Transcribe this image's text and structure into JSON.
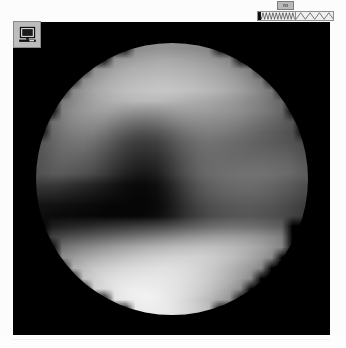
{
  "window": {
    "title": "Image Viewer"
  },
  "toolbar": {
    "display_button": {
      "name": "display-settings-button",
      "icon": "monitor-icon",
      "tooltip": "Display"
    }
  },
  "waveform_widget": {
    "label": "m",
    "dense_pane_name": "dense-waveform",
    "sparse_pane_name": "sparse-waveform",
    "tick_name": "waveform-cursor",
    "dense_cycles": 11,
    "sparse_cycles": 4,
    "border_color": "#8e8e8e",
    "background_color": "#efefef",
    "label_background": "#b9b9b9"
  },
  "viewport": {
    "name": "image-canvas",
    "background_color": "#000000",
    "width": 317,
    "height": 313
  },
  "image": {
    "subject": "grayscale-sphere",
    "description": "Pixelated grayscale image of an illuminated sphere (planetary disk) on a black background",
    "diameter_px": 272,
    "colormap": "grayscale",
    "features": {
      "bright_bottom_limb": true,
      "dark_equatorial_band": true,
      "bright_patch_right_of_center": true,
      "dark_blotch_center": true
    }
  },
  "chart_data": {
    "type": "heatmap",
    "title": "",
    "xlabel": "",
    "ylabel": "",
    "grid": false,
    "cmap": "gray",
    "vmin": 0,
    "vmax": 255,
    "mask": "circular-disk",
    "nrows": 26,
    "ncols": 26,
    "values": [
      [
        0,
        0,
        0,
        0,
        0,
        0,
        0,
        128,
        140,
        146,
        150,
        152,
        152,
        150,
        148,
        144,
        140,
        132,
        0,
        0,
        0,
        0,
        0,
        0,
        0,
        0
      ],
      [
        0,
        0,
        0,
        0,
        0,
        130,
        142,
        152,
        158,
        162,
        165,
        168,
        168,
        166,
        163,
        159,
        154,
        148,
        140,
        130,
        0,
        0,
        0,
        0,
        0,
        0
      ],
      [
        0,
        0,
        0,
        126,
        136,
        148,
        158,
        166,
        172,
        176,
        178,
        180,
        180,
        178,
        175,
        171,
        166,
        160,
        152,
        142,
        130,
        120,
        0,
        0,
        0,
        0
      ],
      [
        0,
        0,
        122,
        134,
        146,
        158,
        168,
        176,
        182,
        186,
        188,
        190,
        190,
        188,
        185,
        181,
        176,
        170,
        162,
        152,
        140,
        128,
        116,
        0,
        0,
        0
      ],
      [
        0,
        118,
        130,
        142,
        154,
        166,
        176,
        184,
        190,
        194,
        196,
        198,
        198,
        196,
        193,
        189,
        184,
        178,
        170,
        160,
        148,
        136,
        124,
        112,
        0,
        0
      ],
      [
        0,
        114,
        128,
        140,
        152,
        164,
        172,
        178,
        182,
        185,
        186,
        186,
        184,
        180,
        176,
        172,
        168,
        162,
        156,
        148,
        138,
        128,
        118,
        108,
        0,
        0
      ],
      [
        106,
        120,
        132,
        144,
        152,
        158,
        160,
        158,
        152,
        148,
        146,
        148,
        152,
        156,
        158,
        158,
        156,
        152,
        148,
        142,
        134,
        126,
        116,
        106,
        96,
        0
      ],
      [
        100,
        114,
        126,
        136,
        142,
        144,
        140,
        130,
        120,
        114,
        112,
        116,
        124,
        132,
        138,
        140,
        140,
        138,
        134,
        128,
        120,
        112,
        104,
        96,
        88,
        0
      ],
      [
        96,
        108,
        118,
        126,
        130,
        128,
        118,
        104,
        92,
        84,
        82,
        86,
        96,
        108,
        118,
        124,
        126,
        124,
        120,
        114,
        108,
        100,
        94,
        88,
        82,
        0
      ],
      [
        92,
        102,
        110,
        116,
        116,
        110,
        98,
        84,
        70,
        62,
        60,
        64,
        76,
        90,
        102,
        110,
        114,
        112,
        108,
        104,
        100,
        96,
        92,
        88,
        84,
        78
      ],
      [
        90,
        98,
        104,
        106,
        104,
        96,
        84,
        70,
        58,
        50,
        48,
        52,
        64,
        80,
        94,
        104,
        108,
        108,
        106,
        104,
        102,
        100,
        98,
        96,
        92,
        86
      ],
      [
        88,
        94,
        98,
        96,
        92,
        84,
        72,
        58,
        46,
        38,
        36,
        40,
        54,
        72,
        88,
        100,
        106,
        108,
        108,
        108,
        108,
        108,
        106,
        104,
        100,
        94
      ],
      [
        86,
        90,
        90,
        86,
        80,
        72,
        60,
        46,
        34,
        26,
        24,
        30,
        46,
        66,
        84,
        98,
        106,
        110,
        112,
        114,
        114,
        114,
        112,
        108,
        104,
        98
      ],
      [
        60,
        58,
        54,
        48,
        42,
        36,
        28,
        20,
        14,
        10,
        10,
        16,
        30,
        50,
        70,
        86,
        96,
        102,
        106,
        108,
        108,
        106,
        102,
        96,
        90,
        84
      ],
      [
        40,
        38,
        34,
        30,
        26,
        22,
        18,
        14,
        10,
        8,
        8,
        12,
        24,
        42,
        62,
        78,
        88,
        94,
        98,
        100,
        100,
        98,
        94,
        88,
        82,
        76
      ],
      [
        20,
        18,
        16,
        14,
        12,
        10,
        8,
        6,
        6,
        6,
        6,
        10,
        20,
        36,
        54,
        68,
        78,
        84,
        88,
        90,
        90,
        88,
        84,
        78,
        72,
        66
      ],
      [
        14,
        12,
        10,
        10,
        8,
        8,
        6,
        6,
        6,
        6,
        8,
        12,
        22,
        36,
        52,
        64,
        74,
        80,
        84,
        86,
        86,
        84,
        80,
        74,
        68,
        62
      ],
      [
        0,
        30,
        34,
        38,
        42,
        46,
        50,
        54,
        58,
        62,
        66,
        70,
        76,
        84,
        92,
        100,
        106,
        110,
        112,
        112,
        110,
        106,
        100,
        94,
        0,
        0
      ],
      [
        0,
        70,
        76,
        82,
        88,
        94,
        100,
        106,
        112,
        118,
        124,
        130,
        136,
        142,
        148,
        152,
        156,
        158,
        158,
        156,
        152,
        146,
        138,
        128,
        0,
        0
      ],
      [
        0,
        110,
        118,
        126,
        134,
        142,
        150,
        158,
        164,
        170,
        176,
        180,
        184,
        188,
        190,
        192,
        192,
        190,
        186,
        180,
        172,
        162,
        150,
        138,
        0,
        0
      ],
      [
        0,
        0,
        150,
        158,
        166,
        174,
        182,
        188,
        194,
        200,
        204,
        208,
        210,
        212,
        212,
        210,
        206,
        200,
        192,
        182,
        170,
        156,
        142,
        0,
        0,
        0
      ],
      [
        0,
        0,
        176,
        184,
        192,
        200,
        206,
        212,
        216,
        220,
        222,
        224,
        224,
        222,
        218,
        212,
        204,
        194,
        182,
        168,
        154,
        138,
        0,
        0,
        0,
        0
      ],
      [
        0,
        0,
        0,
        196,
        204,
        212,
        218,
        224,
        228,
        230,
        232,
        232,
        230,
        226,
        220,
        212,
        202,
        190,
        176,
        160,
        144,
        0,
        0,
        0,
        0,
        0
      ],
      [
        0,
        0,
        0,
        0,
        212,
        220,
        226,
        232,
        236,
        238,
        238,
        236,
        232,
        226,
        218,
        208,
        196,
        182,
        166,
        148,
        0,
        0,
        0,
        0,
        0,
        0
      ],
      [
        0,
        0,
        0,
        0,
        0,
        224,
        232,
        238,
        242,
        244,
        244,
        240,
        234,
        226,
        216,
        204,
        190,
        174,
        156,
        0,
        0,
        0,
        0,
        0,
        0,
        0
      ],
      [
        0,
        0,
        0,
        0,
        0,
        0,
        0,
        236,
        242,
        246,
        248,
        246,
        242,
        234,
        224,
        212,
        198,
        182,
        0,
        0,
        0,
        0,
        0,
        0,
        0,
        0
      ]
    ]
  }
}
